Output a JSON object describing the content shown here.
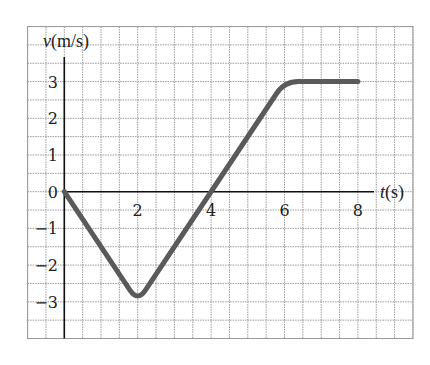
{
  "chart_data": {
    "type": "line",
    "title": "",
    "xlabel": "t(s)",
    "ylabel": "v(m/s)",
    "xlabel_var": "t",
    "xlabel_unit": "(s)",
    "ylabel_var": "v",
    "ylabel_unit": "(m/s)",
    "x_ticks": [
      2,
      4,
      6,
      8
    ],
    "y_ticks": [
      3,
      2,
      1,
      0,
      -1,
      -2,
      -3
    ],
    "y_tick_labels": [
      "3",
      "2",
      "1",
      "0",
      "−1",
      "−2",
      "−3"
    ],
    "grid": true,
    "grid_step": 0.5,
    "xlim": [
      -1,
      9.5
    ],
    "ylim": [
      -4,
      4.5
    ],
    "legend": null,
    "series": [
      {
        "name": "v(t)",
        "x": [
          0,
          2,
          6,
          8
        ],
        "y": [
          0,
          -3,
          3,
          3
        ],
        "color": "#5a5a5a",
        "note": "drawn with rounded corners; visible minimum ≈ -2.75 at t=2"
      }
    ]
  },
  "colors": {
    "curve": "#5a5a5a",
    "grid": "#9a9a9a",
    "axis": "#111111",
    "background": "#ffffff"
  }
}
